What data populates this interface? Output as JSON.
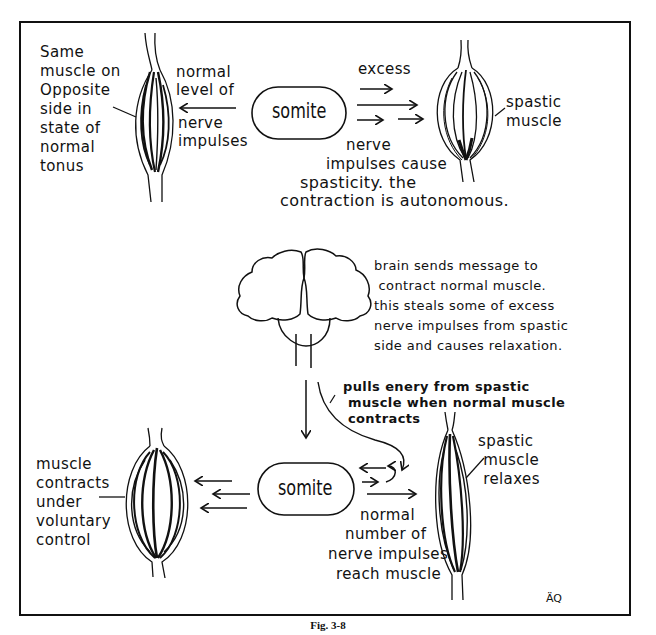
{
  "figure": {
    "caption": "Fig. 3-8",
    "signature": "ÄQ"
  },
  "top_panel": {
    "normal_muscle_label": [
      "Same",
      "muscle on",
      "Opposite",
      "side in",
      "state of",
      "normal",
      "tonus"
    ],
    "left_arrow_label": [
      "normal",
      "level of",
      "nerve",
      "impulses"
    ],
    "somite_label": "somite",
    "excess_label": "excess",
    "spastic_muscle_label": [
      "spastic",
      "muscle"
    ],
    "impulse_note": [
      "nerve",
      "impulses cause",
      "spasticity. the",
      "contraction is autonomous."
    ]
  },
  "bottom_panel": {
    "brain_note": [
      "brain sends message to",
      "contract normal muscle.",
      "this steals some of excess",
      "nerve impulses from spastic",
      "side and causes relaxation."
    ],
    "pull_note": [
      "pulls enery from spastic",
      "muscle when normal muscle",
      "contracts"
    ],
    "voluntary_label": [
      "muscle",
      "contracts",
      "under",
      "voluntary",
      "control"
    ],
    "somite_label": "somite",
    "relaxes_label": [
      "spastic",
      "muscle",
      "relaxes"
    ],
    "normal_number_note": [
      "normal",
      "number of",
      "nerve impulses",
      "reach muscle"
    ]
  }
}
